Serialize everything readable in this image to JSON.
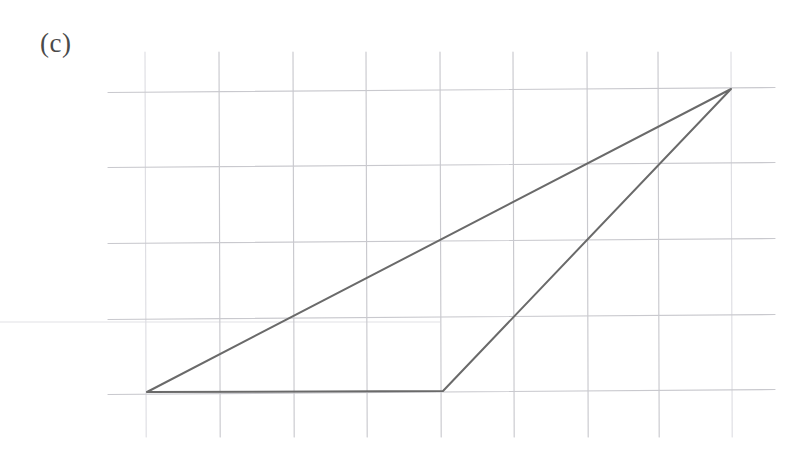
{
  "figure": {
    "panel_label": "(c)",
    "label_position": {
      "x": 40,
      "y": 30
    },
    "width": 809,
    "height": 467,
    "background_color": "#ffffff",
    "medium": "scanned graph paper with ruled triangle"
  },
  "colors": {
    "background": "#ffffff",
    "grid_line": "#c9c9ce",
    "grid_line_faint": "#dedee3",
    "triangle_stroke": "#6a6a6a",
    "label_text": "#4a4a4a",
    "scan_artifact": "#ebebee"
  },
  "chart_data": {
    "type": "scatter",
    "title": "(c)",
    "xlabel": "",
    "ylabel": "",
    "grid": true,
    "legend_position": "none",
    "xlim": [
      0,
      8
    ],
    "ylim": [
      0,
      4
    ],
    "grid_spacing_px": {
      "x": 73.3,
      "y": 75.5
    },
    "grid_origin_px": {
      "x": 145,
      "y": 392
    },
    "grid_vertical_lines_px": [
      145,
      219,
      293,
      366,
      440,
      513,
      587,
      658,
      731
    ],
    "grid_horizontal_lines_px": [
      90,
      165,
      241,
      317,
      392
    ],
    "grid_vertical_extent_px": {
      "top": 52,
      "bottom": 437
    },
    "grid_horizontal_extent_px": {
      "left": 108,
      "right": 775
    },
    "shapes": [
      {
        "name": "triangle",
        "closed": true,
        "stroke": "#6a6a6a",
        "stroke_width": 2,
        "fill": "none",
        "vertices_px": [
          {
            "label": "A",
            "x": 147,
            "y": 392
          },
          {
            "label": "B",
            "x": 443,
            "y": 391
          },
          {
            "label": "C",
            "x": 731,
            "y": 89
          }
        ],
        "vertices_grid": [
          {
            "label": "A",
            "x": 0,
            "y": 0
          },
          {
            "label": "B",
            "x": 4,
            "y": 0
          },
          {
            "label": "C",
            "x": 8,
            "y": 4
          }
        ],
        "edges": [
          {
            "name": "base",
            "from": "A",
            "to": "B"
          },
          {
            "name": "right-slope",
            "from": "B",
            "to": "C"
          },
          {
            "name": "hypotenuse",
            "from": "C",
            "to": "A"
          }
        ]
      }
    ],
    "annotations": [
      {
        "text": "(c)",
        "x_px": 45,
        "y_px": 44,
        "role": "panel-label"
      }
    ],
    "scan_artifacts": [
      {
        "type": "horizontal-streak",
        "y_px": 322,
        "x_start_px": 0,
        "x_end_px": 440
      }
    ]
  }
}
